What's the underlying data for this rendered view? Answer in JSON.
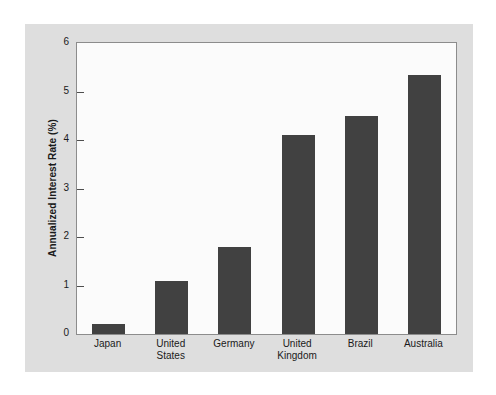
{
  "chart_data": {
    "type": "bar",
    "title": "",
    "subtitle": "",
    "xlabel": "",
    "ylabel": "Annualized Interest Rate (%)",
    "categories": [
      "Japan",
      "United States",
      "Germany",
      "United Kingdom",
      "Brazil",
      "Australia"
    ],
    "category_lines": [
      [
        "Japan"
      ],
      [
        "United",
        "States"
      ],
      [
        "Germany"
      ],
      [
        "United",
        "Kingdom"
      ],
      [
        "Brazil"
      ],
      [
        "Australia"
      ]
    ],
    "values": [
      0.2,
      1.1,
      1.8,
      4.1,
      4.5,
      5.35
    ],
    "ylim": [
      0,
      6
    ],
    "yticks": [
      0,
      1,
      2,
      3,
      4,
      5,
      6
    ],
    "ytick_labels": [
      "0",
      "1",
      "2",
      "3",
      "4",
      "5",
      "6"
    ],
    "grid": false,
    "legend": null,
    "legend_position": "none",
    "bar_color": "#414141",
    "plot_background": "#fbfbfb",
    "figure_background": "#dedede",
    "axis_color": "#8c8c8c",
    "text_color": "#1a1a1a"
  }
}
